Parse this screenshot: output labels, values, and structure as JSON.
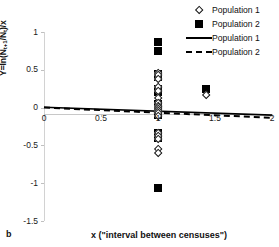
{
  "panel": {
    "label": "b"
  },
  "chart_data": {
    "type": "scatter",
    "title": "",
    "subtitle": "",
    "xlabel": "x (\"interval between censuses\")",
    "ylabel": "Y=ln(Nt+1/Nt)/x",
    "ylabel_parts": {
      "prefix": "Y=ln(N",
      "sub1": "t+1",
      "mid": "/N",
      "sub2": "t",
      "suffix": ")/x"
    },
    "xlim": [
      0,
      2
    ],
    "ylim": [
      -1.5,
      1
    ],
    "xticks": [
      0,
      0.5,
      1,
      1.5,
      2
    ],
    "xtick_labels": [
      "0",
      "0.5",
      "1",
      "1.5",
      "2"
    ],
    "yticks": [
      1,
      0.5,
      0,
      -0.5,
      -1,
      -1.5
    ],
    "ytick_labels": [
      "1",
      "0.5",
      "0",
      "-0.5",
      "-1",
      "-1.5"
    ],
    "grid": false,
    "legend_position": "top-right",
    "colors": {
      "marker": "#000000",
      "line": "#000000",
      "axis": "#c8c8c8",
      "background": "#ffffff"
    },
    "legend": [
      {
        "label": "Population 1",
        "marker": "open-diamond",
        "key": "diamond"
      },
      {
        "label": "Population 2",
        "marker": "filled-square",
        "key": "square"
      },
      {
        "label": "Population 1",
        "marker": "solid-line",
        "key": "solid"
      },
      {
        "label": "Population 2",
        "marker": "dashed-line",
        "key": "dashed"
      }
    ],
    "series": [
      {
        "name": "Population 1",
        "marker": "open-diamond",
        "x": [
          1,
          1,
          1,
          1,
          1,
          1,
          1,
          1,
          1,
          1,
          1,
          1,
          1,
          1,
          1,
          1,
          1,
          1,
          1.42
        ],
        "y": [
          0.46,
          0.43,
          0.38,
          0.27,
          0.22,
          0.12,
          0.06,
          0.02,
          0.0,
          -0.02,
          -0.05,
          -0.08,
          -0.12,
          -0.34,
          -0.38,
          -0.42,
          -0.55,
          -0.6,
          0.17
        ]
      },
      {
        "name": "Population 2",
        "marker": "filled-square",
        "x": [
          1,
          1,
          1,
          1,
          1,
          1,
          1,
          1,
          1,
          1,
          1,
          1,
          1,
          1,
          1,
          1.42
        ],
        "y": [
          0.87,
          0.75,
          0.44,
          0.41,
          0.25,
          0.21,
          0.05,
          0.01,
          -0.03,
          -0.06,
          -0.1,
          -0.33,
          -0.37,
          -1.07,
          -0.4,
          0.25
        ]
      }
    ],
    "trendlines": [
      {
        "name": "Population 1",
        "style": "solid",
        "x0": 0,
        "y0": 0.005,
        "x1": 2,
        "y1": -0.1
      },
      {
        "name": "Population 2",
        "style": "dashed",
        "x0": 0,
        "y0": 0.0,
        "x1": 2,
        "y1": -0.135
      }
    ]
  }
}
